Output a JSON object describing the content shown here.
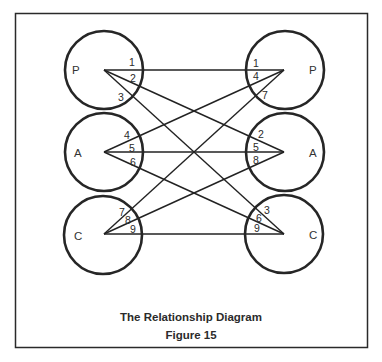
{
  "diagram": {
    "caption": {
      "title": "The Relationship Diagram",
      "figure": "Figure 15"
    },
    "left_nodes": [
      {
        "label": "P",
        "numbers": [
          "1",
          "2",
          "3"
        ]
      },
      {
        "label": "A",
        "numbers": [
          "4",
          "5",
          "6"
        ]
      },
      {
        "label": "C",
        "numbers": [
          "7",
          "8",
          "9"
        ]
      }
    ],
    "right_nodes": [
      {
        "label": "P",
        "numbers": [
          "1",
          "4",
          "7"
        ]
      },
      {
        "label": "A",
        "numbers": [
          "2",
          "5",
          "8"
        ]
      },
      {
        "label": "C",
        "numbers": [
          "3",
          "6",
          "9"
        ]
      }
    ],
    "connections": [
      {
        "id": "1",
        "from": "P",
        "to": "P"
      },
      {
        "id": "2",
        "from": "P",
        "to": "A"
      },
      {
        "id": "3",
        "from": "P",
        "to": "C"
      },
      {
        "id": "4",
        "from": "A",
        "to": "P"
      },
      {
        "id": "5",
        "from": "A",
        "to": "A"
      },
      {
        "id": "6",
        "from": "A",
        "to": "C"
      },
      {
        "id": "7",
        "from": "C",
        "to": "P"
      },
      {
        "id": "8",
        "from": "C",
        "to": "A"
      },
      {
        "id": "9",
        "from": "C",
        "to": "C"
      }
    ],
    "colors": {
      "stroke": "#262626",
      "background": "#ffffff"
    }
  }
}
